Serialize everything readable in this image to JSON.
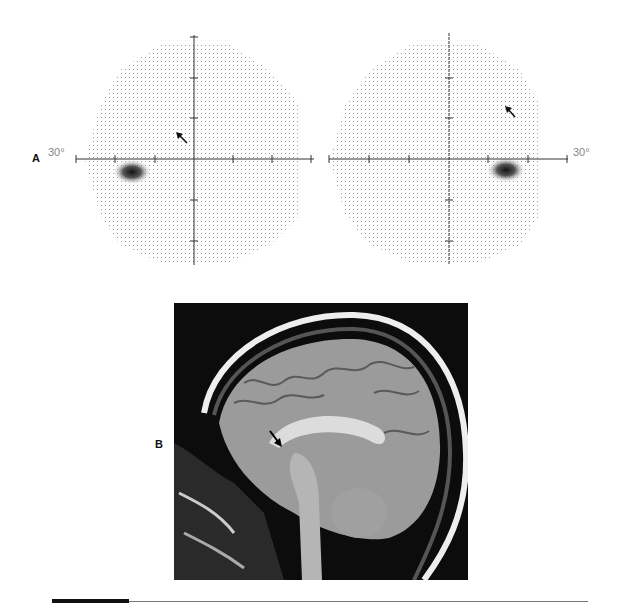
{
  "figure": {
    "panels": [
      {
        "label": "A",
        "type": "visual-field-plots",
        "plots": [
          {
            "eye": "left",
            "degree_label": "30°",
            "center": [
              194,
              159
            ],
            "arrow": "inferonasal-pointing arrow in superior field",
            "dense_spot": "blind spot temporal-inferior"
          },
          {
            "eye": "right",
            "degree_label": "30°",
            "center": [
              449,
              159
            ],
            "arrow": "arrow in superotemporal field",
            "dense_spot": "blind spot temporal-inferior"
          }
        ]
      },
      {
        "label": "B",
        "type": "sagittal-MRI",
        "arrow": "arrow pointing to optic chiasm region"
      }
    ],
    "colors": {
      "axis": "#333333",
      "dots": "#9a9a9a",
      "dense": "#222222",
      "mri_bg": "#0c0c0c"
    }
  }
}
